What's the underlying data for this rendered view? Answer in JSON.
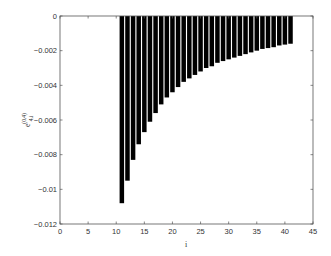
{
  "chart_data": {
    "type": "bar",
    "title": "",
    "xlabel": "i",
    "ylabel": "e_{4,i}^{(0,4)}",
    "ylabel_parts": {
      "base": "e",
      "sub": "4,i",
      "sup": "(0,4)"
    },
    "xlim": [
      0,
      45
    ],
    "ylim": [
      -0.012,
      0
    ],
    "xticks": [
      0,
      5,
      10,
      15,
      20,
      25,
      30,
      35,
      40,
      45
    ],
    "yticks": [
      0,
      -0.002,
      -0.004,
      -0.006,
      -0.008,
      -0.01,
      -0.012
    ],
    "xtick_labels": [
      "0",
      "5",
      "10",
      "15",
      "20",
      "25",
      "30",
      "35",
      "40",
      "45"
    ],
    "ytick_labels": [
      "0",
      "-0.002",
      "-0.004",
      "-0.006",
      "-0.008",
      "-0.01",
      "-0.012"
    ],
    "grid": false,
    "legend": null,
    "bar_color": "#000000",
    "categories": [
      11,
      12,
      13,
      14,
      15,
      16,
      17,
      18,
      19,
      20,
      21,
      22,
      23,
      24,
      25,
      26,
      27,
      28,
      29,
      30,
      31,
      32,
      33,
      34,
      35,
      36,
      37,
      38,
      39,
      40,
      41
    ],
    "values": [
      -0.0108,
      -0.0095,
      -0.0083,
      -0.0074,
      -0.0067,
      -0.0061,
      -0.0056,
      -0.0051,
      -0.0047,
      -0.0044,
      -0.0041,
      -0.0038,
      -0.0036,
      -0.0034,
      -0.0032,
      -0.003,
      -0.0029,
      -0.0027,
      -0.0026,
      -0.0025,
      -0.0024,
      -0.0023,
      -0.0022,
      -0.0021,
      -0.002,
      -0.0019,
      -0.00185,
      -0.0018,
      -0.0017,
      -0.00165,
      -0.0016
    ]
  }
}
